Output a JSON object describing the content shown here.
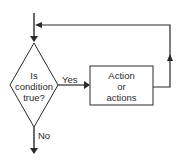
{
  "diagram": {
    "type": "flowchart-loop",
    "decision": {
      "lines": [
        "Is",
        "condition",
        "true?"
      ]
    },
    "action": {
      "lines": [
        "Action",
        "or",
        "actions"
      ]
    },
    "edges": {
      "yes_label": "Yes",
      "no_label": "No"
    },
    "colors": {
      "stroke": "#2a2a2a",
      "background": "#ffffff"
    }
  }
}
